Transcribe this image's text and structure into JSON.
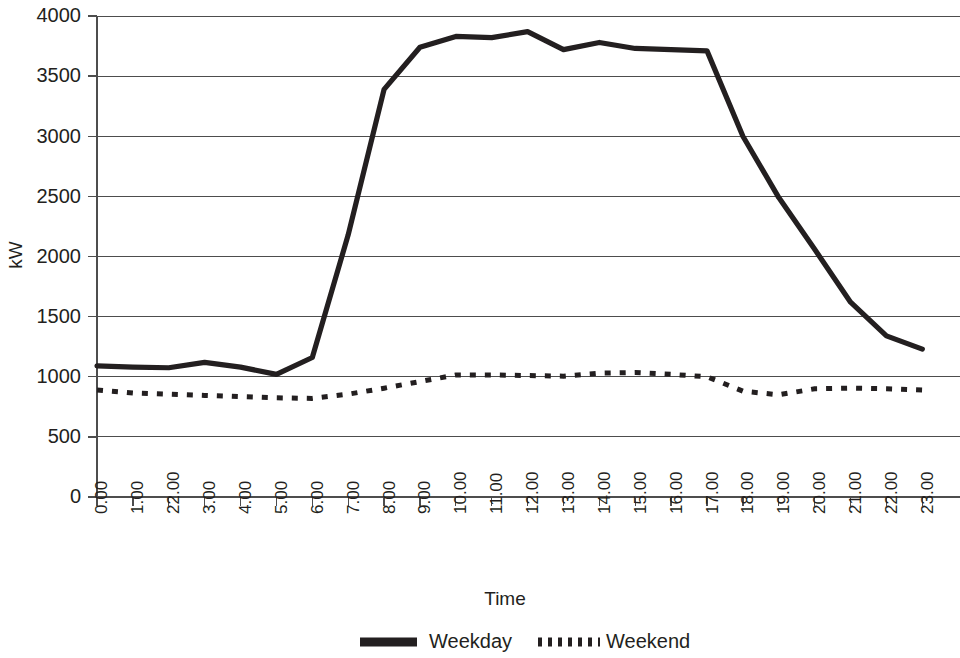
{
  "chart_data": {
    "type": "line",
    "title": "",
    "xlabel": "Time",
    "ylabel": "kW",
    "categories": [
      "0.00",
      "1.00",
      "22.00",
      "3.00",
      "4.00",
      "5.00",
      "6.00",
      "7.00",
      "8.00",
      "9.00",
      "10.00",
      "11.00",
      "12.00",
      "13.00",
      "14.00",
      "15.00",
      "16.00",
      "17.00",
      "18.00",
      "19.00",
      "20.00",
      "21.00",
      "22.00",
      "23.00"
    ],
    "ylim": [
      0,
      4000
    ],
    "yticks": [
      0,
      500,
      1000,
      1500,
      2000,
      2500,
      3000,
      3500,
      4000
    ],
    "ytick_labels": [
      "0",
      "500",
      "1000",
      "1500",
      "2000",
      "2500",
      "3000",
      "3500",
      "4000"
    ],
    "grid": true,
    "legend_position": "bottom",
    "series": [
      {
        "name": "Weekday",
        "style": "solid",
        "color": "#231f20",
        "values": [
          1090,
          1080,
          1075,
          1120,
          1080,
          1020,
          1160,
          2180,
          3390,
          3740,
          3830,
          3820,
          3870,
          3720,
          3780,
          3730,
          3720,
          3710,
          3000,
          2490,
          2060,
          1620,
          1340,
          1230
        ]
      },
      {
        "name": "Weekend",
        "style": "dotted",
        "color": "#231f20",
        "values": [
          890,
          865,
          855,
          845,
          835,
          825,
          820,
          855,
          905,
          960,
          1015,
          1015,
          1010,
          1005,
          1030,
          1035,
          1020,
          1000,
          880,
          850,
          900,
          905,
          900,
          890
        ]
      }
    ]
  },
  "legend": {
    "items": [
      {
        "label": "Weekday",
        "style": "solid"
      },
      {
        "label": "Weekend",
        "style": "dotted"
      }
    ]
  },
  "axes": {
    "x_title": "Time",
    "y_title": "kW"
  }
}
